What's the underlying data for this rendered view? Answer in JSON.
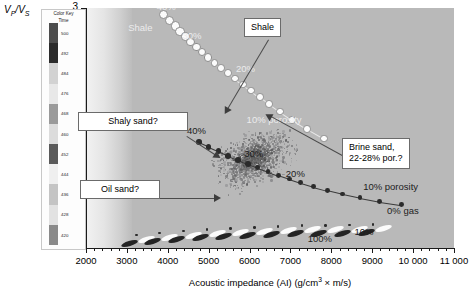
{
  "chart_data": {
    "type": "scatter",
    "title": "",
    "xlabel": "Acoustic impedance (AI) (g/cm3 x m/s)",
    "ylabel": "Vp/Vs",
    "xlim": [
      2000,
      11000
    ],
    "ylim": [
      1.4,
      3.0
    ],
    "xticks": [
      2000,
      3000,
      4000,
      5000,
      6000,
      7000,
      8000,
      9000,
      10000,
      11000
    ],
    "xtick_labels": [
      "2000",
      "3000",
      "4000",
      "5000",
      "6000",
      "7000",
      "8000",
      "9000",
      "10 000",
      "11 000"
    ],
    "yticks": [
      1.4,
      1.6,
      1.8,
      2.0,
      2.2,
      2.4,
      2.6,
      2.8,
      3.0
    ],
    "ytick_labels": [
      "1.4",
      "1.6",
      "1.8",
      "2",
      "2.2",
      "2.4",
      "2.6",
      "2.8",
      "3"
    ],
    "grid": false,
    "legend_position": "left-inset",
    "series": [
      {
        "name": "Shale trend (porosity 40% to 10%)",
        "marker": "open-circle",
        "x": [
          3900,
          4050,
          4180,
          4300,
          4430,
          4560,
          4700,
          4840,
          4990,
          5140,
          5300,
          5470,
          5650,
          5840,
          6040,
          6250,
          6480,
          6740,
          7040,
          7400,
          7820
        ],
        "y": [
          2.955,
          2.915,
          2.88,
          2.845,
          2.81,
          2.775,
          2.74,
          2.705,
          2.67,
          2.635,
          2.6,
          2.565,
          2.53,
          2.49,
          2.45,
          2.405,
          2.36,
          2.31,
          2.255,
          2.195,
          2.13
        ]
      },
      {
        "name": "Brine sand trend (porosity 40% to 10%, 0% gas)",
        "marker": "filled-circle",
        "x": [
          4760,
          5000,
          5240,
          5480,
          5720,
          5960,
          6200,
          6450,
          6700,
          6970,
          7250,
          7560,
          7900,
          8280,
          8700,
          9180,
          9720
        ],
        "y": [
          2.105,
          2.075,
          2.045,
          2.015,
          1.988,
          1.96,
          1.935,
          1.91,
          1.885,
          1.86,
          1.835,
          1.81,
          1.785,
          1.76,
          1.735,
          1.71,
          1.688
        ]
      },
      {
        "name": "Gas saturation lozenge trend (100% to 10% gas)",
        "marker": "lozenge",
        "x": [
          3050,
          3620,
          4200,
          4780,
          5360,
          5940,
          6520,
          7100,
          7680,
          8260,
          8840
        ],
        "y": [
          1.435,
          1.45,
          1.462,
          1.472,
          1.48,
          1.487,
          1.492,
          1.497,
          1.5,
          1.503,
          1.505
        ]
      },
      {
        "name": "Well log data cloud",
        "marker": "dot-cloud",
        "x_center": 6100,
        "y_center": 2.0,
        "n_points": 1150
      }
    ],
    "annotations": [
      {
        "text": "40%",
        "x": 3960,
        "y": 3.0,
        "style": "white"
      },
      {
        "text": "Shale",
        "x": 3330,
        "y": 2.86,
        "style": "white"
      },
      {
        "text": "30%",
        "x": 4590,
        "y": 2.81,
        "style": "white"
      },
      {
        "text": "20%",
        "x": 5900,
        "y": 2.585,
        "style": "white"
      },
      {
        "text": "10% porosity",
        "x": 6600,
        "y": 2.25,
        "style": "white"
      },
      {
        "text": "40%",
        "x": 4700,
        "y": 2.175,
        "style": "dark"
      },
      {
        "text": "30%",
        "x": 6100,
        "y": 2.02,
        "style": "dark"
      },
      {
        "text": "20%",
        "x": 7120,
        "y": 1.885,
        "style": "dark"
      },
      {
        "text": "10% porosity",
        "x": 9450,
        "y": 1.8,
        "style": "dark"
      },
      {
        "text": "0% gas",
        "x": 9750,
        "y": 1.64,
        "style": "dark"
      },
      {
        "text": "100%",
        "x": 7720,
        "y": 1.455,
        "style": "dark"
      },
      {
        "text": "10%",
        "x": 8800,
        "y": 1.5,
        "style": "dark"
      }
    ],
    "callouts": [
      {
        "label": "Shale",
        "box_x": 5400,
        "box_y": 2.95
      },
      {
        "label": "Shaly sand?",
        "box_x": 3350,
        "box_y": 2.36
      },
      {
        "label": "Brine sand,\n22-28% por.?",
        "box_x": 8550,
        "box_y": 2.14
      },
      {
        "label": "Oil sand?",
        "box_x": 3150,
        "box_y": 1.86
      }
    ]
  },
  "colorkey": {
    "title_line1": "Color Key",
    "title_line2": "Time",
    "labels": [
      "500",
      "492",
      "484",
      "476",
      "468",
      "460",
      "452",
      "444",
      "436",
      "428",
      "420"
    ],
    "colors": [
      "#4d4d4d",
      "#2b2b2b",
      "#d2d2d2",
      "#e8e8e8",
      "#9a9a9a",
      "#dcdcdc",
      "#5a5a5a",
      "#efefef",
      "#c4c4c4",
      "#e2e2e2",
      "#8a8a8a"
    ]
  },
  "axes": {
    "x_title_main": "Acoustic impedance (AI) (g/cm",
    "x_title_sup": "3",
    "x_title_tail": " × m/s)",
    "y_title_p": "P",
    "y_title_s": "S",
    "y_title_v": "V"
  },
  "labels": {
    "shale_callout": "Shale",
    "shaly_sand_callout": "Shaly sand?",
    "oil_sand_callout": "Oil sand?",
    "brine_line1": "Brine sand,",
    "brine_line2": "22-28% por.?",
    "pct40_upper": "40%",
    "pct30_upper": "30%",
    "pct20_upper": "20%",
    "pct10_upper": "10% porosity",
    "shale_inline": "Shale",
    "pct40_mid": "40%",
    "pct30_mid": "30%",
    "pct20_mid": "20%",
    "pct10_mid": "10% porosity",
    "gas0": "0% gas",
    "gas100": "100%",
    "gas10": "10%"
  }
}
